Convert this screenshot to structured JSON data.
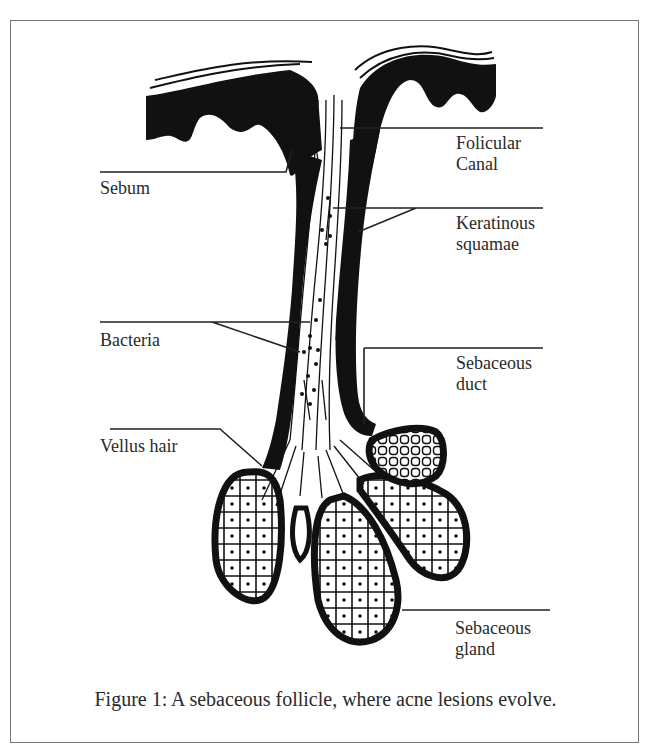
{
  "figure": {
    "caption": "Figure 1: A sebaceous follicle, where acne lesions evolve.",
    "labels": {
      "sebum": "Sebum",
      "bacteria": "Bacteria",
      "vellus_hair": "Vellus hair",
      "folicular_canal_line1": "Folicular",
      "folicular_canal_line2": "Canal",
      "keratinous_squamae_line1": "Keratinous",
      "keratinous_squamae_line2": "squamae",
      "sebaceous_duct_line1": "Sebaceous",
      "sebaceous_duct_line2": "duct",
      "sebaceous_gland_line1": "Sebaceous",
      "sebaceous_gland_line2": "gland"
    },
    "colors": {
      "ink": "#111111",
      "text": "#2a2a2a",
      "frame": "#777777",
      "background": "#ffffff"
    }
  }
}
